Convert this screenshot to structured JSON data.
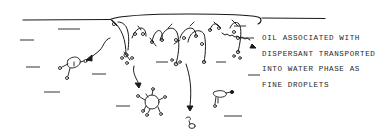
{
  "diagram": {
    "type": "hand-drawn schematic",
    "annotation": {
      "lines": [
        "OIL ASSOCIATED WITH",
        "DISPERSANT TRANSPORTED",
        "INTO WATER PHASE AS",
        "FINE DROPLETS"
      ]
    },
    "elements": {
      "water_surface": "water-surface-line",
      "oil_slick": "surface-oil-layer-with-dispersant-molecules",
      "droplets": [
        "droplet-with-surfactant-left",
        "droplet-with-surfactant-center-large",
        "droplet-small-center-bottom",
        "droplet-with-surfactant-right"
      ],
      "arrows": [
        "arrow-curved-left-down",
        "arrow-curved-center-down",
        "arrow-curved-center-right-down",
        "arrow-wavy-right-down"
      ]
    },
    "colors": {
      "ink": "#1a1a1a",
      "background": "#ffffff"
    }
  }
}
